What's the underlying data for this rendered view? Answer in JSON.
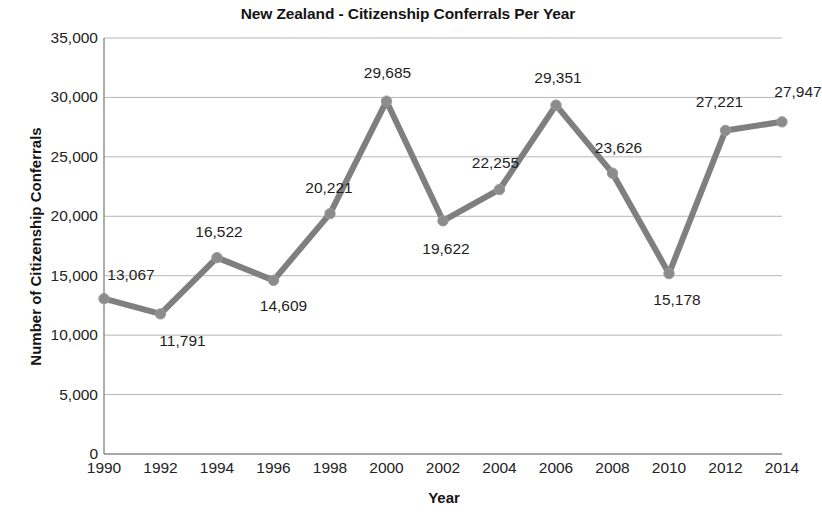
{
  "chart_data": {
    "type": "line",
    "title": "New Zealand - Citizenship Conferrals Per Year",
    "xlabel": "Year",
    "ylabel": "Number of Citizenship Conferrals",
    "categories": [
      "1990",
      "1992",
      "1994",
      "1996",
      "1998",
      "2000",
      "2002",
      "2004",
      "2006",
      "2008",
      "2010",
      "2012",
      "2014"
    ],
    "values": [
      13067,
      11791,
      16522,
      14609,
      20221,
      29685,
      19622,
      22255,
      29351,
      23626,
      15178,
      27221,
      27947
    ],
    "value_labels": [
      "13,067",
      "11,791",
      "16,522",
      "14,609",
      "20,221",
      "29,685",
      "19,622",
      "22,255",
      "29,351",
      "23,626",
      "15,178",
      "27,221",
      "27,947"
    ],
    "ylim": [
      0,
      35000
    ],
    "ytick_values": [
      0,
      5000,
      10000,
      15000,
      20000,
      25000,
      30000,
      35000
    ],
    "ytick_labels": [
      "0",
      "5,000",
      "10,000",
      "15,000",
      "20,000",
      "25,000",
      "30,000",
      "35,000"
    ],
    "grid": true,
    "legend": "none",
    "series_color": "#7f7f7f",
    "marker_color": "#8c8c8c",
    "gridline_color": "#b6b6b6",
    "axis_color": "#8a8a8a",
    "background": "#ffffff",
    "data_labels_shown": true
  }
}
